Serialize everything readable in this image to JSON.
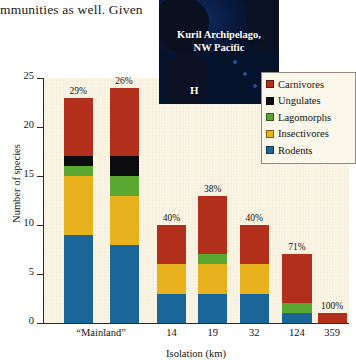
{
  "body_text": "mmunities as well. Given",
  "inset": {
    "title_line1": "Kuril Archipelago,",
    "title_line2": "NW Pacific",
    "marker": "H"
  },
  "legend": {
    "items": [
      {
        "label": "Carnivores",
        "color": "#b2301b"
      },
      {
        "label": "Ungulates",
        "color": "#0b0b10"
      },
      {
        "label": "Lagomorphs",
        "color": "#5aa832"
      },
      {
        "label": "Insectivores",
        "color": "#e8b11e"
      },
      {
        "label": "Rodents",
        "color": "#1a6699"
      }
    ]
  },
  "chart_data": {
    "type": "bar",
    "subtype": "stacked",
    "title": "",
    "xlabel": "Isolation (km)",
    "ylabel": "Number of species",
    "ylim": [
      0,
      25
    ],
    "yticks": [
      0,
      5,
      10,
      15,
      20,
      25
    ],
    "grid": false,
    "legend_position": "top-right",
    "categories": [
      "“Mainland”",
      "14",
      "19",
      "32",
      "124",
      "359"
    ],
    "series": [
      {
        "name": "Rodents",
        "color": "#1a6699",
        "values": [
          9,
          3,
          3,
          3,
          1,
          0
        ]
      },
      {
        "name": "Insectivores",
        "color": "#e8b11e",
        "values": [
          6,
          3,
          3,
          3,
          0,
          0
        ]
      },
      {
        "name": "Lagomorphs",
        "color": "#5aa832",
        "values": [
          1,
          0,
          1,
          0,
          1,
          0
        ]
      },
      {
        "name": "Ungulates",
        "color": "#0b0b10",
        "values": [
          1,
          0,
          0,
          0,
          0,
          0
        ]
      },
      {
        "name": "Carnivores",
        "color": "#b2301b",
        "values": [
          6,
          4,
          6,
          4,
          5,
          1
        ]
      }
    ],
    "totals": [
      23,
      10,
      13,
      10,
      7,
      1
    ],
    "annotations": [
      "29%",
      "26%",
      "40%",
      "38%",
      "40%",
      "71%",
      "100%"
    ],
    "bar_annotations": [
      {
        "category": "“Mainland”",
        "bar_index": 0,
        "label": "29%"
      },
      {
        "category": "“Mainland”",
        "bar_index": 1,
        "label": "26%"
      },
      {
        "category": "14",
        "bar_index": 2,
        "label": "40%"
      },
      {
        "category": "19",
        "bar_index": 3,
        "label": "38%"
      },
      {
        "category": "32",
        "bar_index": 4,
        "label": "40%"
      },
      {
        "category": "124",
        "bar_index": 5,
        "label": "71%"
      },
      {
        "category": "359",
        "bar_index": 6,
        "label": "100%"
      }
    ],
    "bars": [
      {
        "category": "“Mainland”",
        "annotation": "29%",
        "total": 23,
        "stack": [
          {
            "name": "Rodents",
            "value": 9
          },
          {
            "name": "Insectivores",
            "value": 6
          },
          {
            "name": "Lagomorphs",
            "value": 1
          },
          {
            "name": "Ungulates",
            "value": 1
          },
          {
            "name": "Carnivores",
            "value": 6
          }
        ]
      },
      {
        "category": "“Mainland”",
        "annotation": "26%",
        "total": 24,
        "stack": [
          {
            "name": "Rodents",
            "value": 8
          },
          {
            "name": "Insectivores",
            "value": 5
          },
          {
            "name": "Lagomorphs",
            "value": 2
          },
          {
            "name": "Ungulates",
            "value": 2
          },
          {
            "name": "Carnivores",
            "value": 7
          }
        ]
      },
      {
        "category": "14",
        "annotation": "40%",
        "total": 10,
        "stack": [
          {
            "name": "Rodents",
            "value": 3
          },
          {
            "name": "Insectivores",
            "value": 3
          },
          {
            "name": "Lagomorphs",
            "value": 0
          },
          {
            "name": "Ungulates",
            "value": 0
          },
          {
            "name": "Carnivores",
            "value": 4
          }
        ]
      },
      {
        "category": "19",
        "annotation": "38%",
        "total": 13,
        "stack": [
          {
            "name": "Rodents",
            "value": 3
          },
          {
            "name": "Insectivores",
            "value": 3
          },
          {
            "name": "Lagomorphs",
            "value": 1
          },
          {
            "name": "Ungulates",
            "value": 0
          },
          {
            "name": "Carnivores",
            "value": 6
          }
        ]
      },
      {
        "category": "32",
        "annotation": "40%",
        "total": 10,
        "stack": [
          {
            "name": "Rodents",
            "value": 3
          },
          {
            "name": "Insectivores",
            "value": 3
          },
          {
            "name": "Lagomorphs",
            "value": 0
          },
          {
            "name": "Ungulates",
            "value": 0
          },
          {
            "name": "Carnivores",
            "value": 4
          }
        ]
      },
      {
        "category": "124",
        "annotation": "71%",
        "total": 7,
        "stack": [
          {
            "name": "Rodents",
            "value": 1
          },
          {
            "name": "Insectivores",
            "value": 0
          },
          {
            "name": "Lagomorphs",
            "value": 1
          },
          {
            "name": "Ungulates",
            "value": 0
          },
          {
            "name": "Carnivores",
            "value": 5
          }
        ]
      },
      {
        "category": "359",
        "annotation": "100%",
        "total": 1,
        "stack": [
          {
            "name": "Rodents",
            "value": 0
          },
          {
            "name": "Insectivores",
            "value": 0
          },
          {
            "name": "Lagomorphs",
            "value": 0
          },
          {
            "name": "Ungulates",
            "value": 0
          },
          {
            "name": "Carnivores",
            "value": 1
          }
        ]
      }
    ],
    "bar_x_centers_pct": [
      11.5,
      26.5,
      42.0,
      55.5,
      69.0,
      83.0,
      94.5
    ],
    "bar_width_pct": 9.5,
    "category_x_centers_pct": [
      19.0,
      42.0,
      55.5,
      69.0,
      83.0,
      94.5
    ],
    "plot_bg_color": "#f7f0dc"
  }
}
